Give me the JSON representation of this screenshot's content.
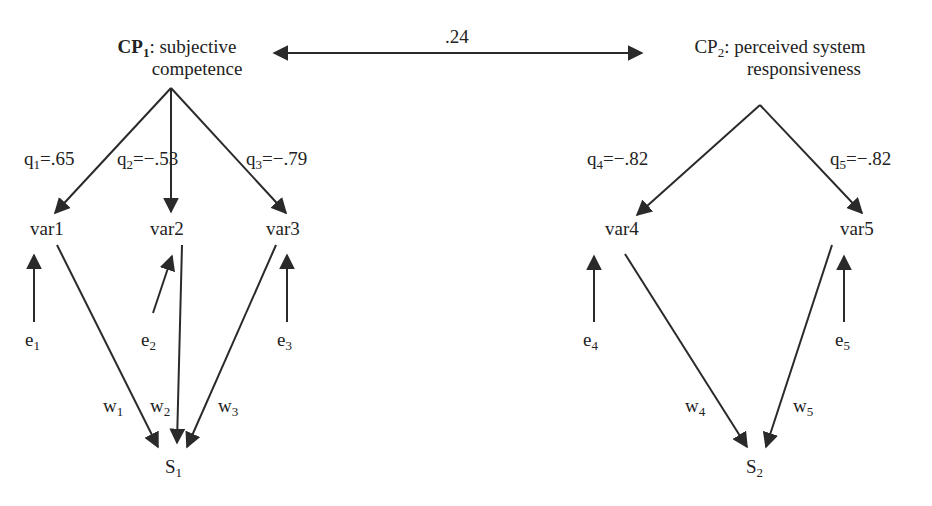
{
  "diagram": {
    "type": "structural-equation-model",
    "correlation": ".24",
    "constructs": [
      {
        "id": "CP1",
        "prefix": "CP",
        "sub": "1",
        "line1": ": subjective",
        "line2": "competence"
      },
      {
        "id": "CP2",
        "prefix": "CP",
        "sub": "2",
        "line1": ": perceived system",
        "line2": "responsiveness"
      }
    ],
    "loadings": [
      {
        "q": "q",
        "sub": "1",
        "val": "=.65"
      },
      {
        "q": "q",
        "sub": "2",
        "val": "=−.53"
      },
      {
        "q": "q",
        "sub": "3",
        "val": "=−.79"
      },
      {
        "q": "q",
        "sub": "4",
        "val": "=−.82"
      },
      {
        "q": "q",
        "sub": "5",
        "val": "=−.82"
      }
    ],
    "variables": [
      "var1",
      "var2",
      "var3",
      "var4",
      "var5"
    ],
    "errors": [
      {
        "e": "e",
        "sub": "1"
      },
      {
        "e": "e",
        "sub": "2"
      },
      {
        "e": "e",
        "sub": "3"
      },
      {
        "e": "e",
        "sub": "4"
      },
      {
        "e": "e",
        "sub": "5"
      }
    ],
    "weights": [
      {
        "w": "w",
        "sub": "1"
      },
      {
        "w": "w",
        "sub": "2"
      },
      {
        "w": "w",
        "sub": "3"
      },
      {
        "w": "w",
        "sub": "4"
      },
      {
        "w": "w",
        "sub": "5"
      }
    ],
    "scores": [
      {
        "s": "S",
        "sub": "1"
      },
      {
        "s": "S",
        "sub": "2"
      }
    ],
    "colors": {
      "line": "#2a2a2a",
      "text": "#222222",
      "background": "#ffffff"
    }
  }
}
